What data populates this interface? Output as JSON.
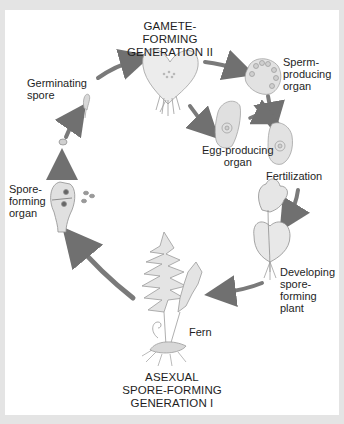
{
  "diagram": {
    "generation_labels": {
      "gametophyte": "GAMETE-FORMING\nGENERATION II",
      "sporophyte": "ASEXUAL\nSPORE-FORMING\nGENERATION I"
    },
    "stage_labels": {
      "germinating_spore": "Germinating\nspore",
      "sperm_organ": "Sperm-\nproducing\norgan",
      "egg_organ": "Egg-producing\norgan",
      "fertilization": "Fertilization",
      "developing_plant": "Developing\nspore-\nforming\nplant",
      "fern": "Fern",
      "spore_organ": "Spore-\nforming\norgan"
    },
    "colors": {
      "border": "#e4e4e4",
      "background": "#ffffff",
      "arrow": "#7a7a7a",
      "illustration_fill": "#e6e6e6",
      "illustration_stroke": "#9a9a9a",
      "text": "#1e1e1e"
    }
  }
}
